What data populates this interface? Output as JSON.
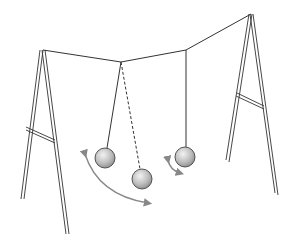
{
  "diagram": {
    "caption_fragment": "· · ·  ·· ·· ···",
    "colors": {
      "line": "#333333",
      "ball_fill_light": "#eeeeee",
      "ball_fill_dark": "#8a8a8a",
      "ball_stroke": "#444444",
      "arrow": "#888888"
    },
    "frames": [
      {
        "name": "left-a-frame",
        "apex": [
          42,
          50
        ],
        "legs": [
          [
            22,
            200
          ],
          [
            68,
            234
          ]
        ],
        "brace_y": [
          128,
          142
        ]
      },
      {
        "name": "right-a-frame",
        "apex": [
          250,
          14
        ],
        "legs": [
          [
            228,
            162
          ],
          [
            279,
            196
          ]
        ],
        "brace_y": [
          95,
          107
        ]
      }
    ],
    "string": {
      "points": [
        [
          42,
          50
        ],
        [
          121,
          62
        ],
        [
          186,
          50
        ],
        [
          250,
          14
        ]
      ]
    },
    "pendulums": [
      {
        "name": "left-pendulum",
        "pivot": [
          121,
          62
        ],
        "bob": [
          105,
          158
        ],
        "style": "solid"
      },
      {
        "name": "middle-pendulum",
        "pivot": [
          121,
          62
        ],
        "bob": [
          142,
          179
        ],
        "style": "dashed"
      },
      {
        "name": "right-pendulum",
        "pivot": [
          186,
          50
        ],
        "bob": [
          185,
          157
        ],
        "style": "solid"
      }
    ],
    "arrows": [
      {
        "name": "large-swing-arrow",
        "description": "curved double-headed arrow showing large swing"
      },
      {
        "name": "small-swing-arrow",
        "description": "small curved arrow showing small swing"
      }
    ]
  }
}
